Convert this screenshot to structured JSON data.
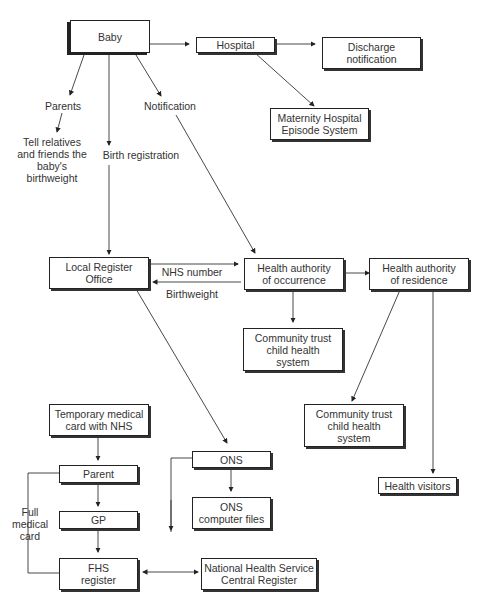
{
  "nodes": {
    "baby": "Baby",
    "hospital": "Hospital",
    "discharge": "Discharge\nnotification",
    "maternity": "Maternity Hospital\nEpisode System",
    "local_register": "Local Register\nOffice",
    "ha_occurrence": "Health authority\nof occurrence",
    "ha_residence": "Health authority\nof residence",
    "ct_occurrence": "Community trust\nchild health\nsystem",
    "ct_residence": "Community trust\nchild health\nsystem",
    "temp_card": "Temporary medical\ncard with NHS",
    "parent": "Parent",
    "gp": "GP",
    "fhs": "FHS\nregister",
    "ons": "ONS",
    "ons_files": "ONS\ncomputer files",
    "nhscr": "National Health Service\nCentral Register",
    "health_visitors": "Health visitors"
  },
  "labels": {
    "parents": "Parents",
    "tell": "Tell relatives\nand friends the\nbaby's\nbirthweight",
    "birth_registration": "Birth registration",
    "notification": "Notification",
    "nhs_number": "NHS number",
    "birthweight": "Birthweight",
    "full_medical_card": "Full\nmedical\ncard"
  }
}
